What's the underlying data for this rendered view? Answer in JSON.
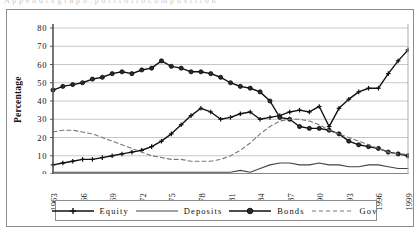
{
  "page": {
    "ghost_header": "A p p e n d i x   g r a p h :  p o r t f o l i o  c o m p o s i t i o n"
  },
  "figure": {
    "y_axis_title": "Percentage"
  },
  "legend": {
    "position": "bottom",
    "items": [
      {
        "label": "Equity",
        "marker": "plus-marker",
        "style": "solid",
        "color": "#111111"
      },
      {
        "label": "Deposits",
        "marker": "none",
        "style": "solid",
        "color": "#444444"
      },
      {
        "label": "Bonds",
        "marker": "circle-marker",
        "style": "solid",
        "color": "#111111"
      },
      {
        "label": "Gov",
        "marker": "none",
        "style": "dashed",
        "color": "#777777"
      }
    ]
  },
  "chart_data": {
    "type": "line",
    "title": "",
    "subtitle": "",
    "xlabel": "",
    "ylabel": "Percentage",
    "ylim": [
      0,
      80
    ],
    "ytick_step": 10,
    "yticks": [
      0,
      10,
      20,
      30,
      40,
      50,
      60,
      70,
      80
    ],
    "grid": true,
    "grid_axis": "y",
    "xlim": [
      1963,
      1999
    ],
    "x": [
      1963,
      1964,
      1965,
      1966,
      1967,
      1968,
      1969,
      1970,
      1971,
      1972,
      1973,
      1974,
      1975,
      1976,
      1977,
      1978,
      1979,
      1980,
      1981,
      1982,
      1983,
      1984,
      1985,
      1986,
      1987,
      1988,
      1989,
      1990,
      1991,
      1992,
      1993,
      1994,
      1995,
      1996,
      1997,
      1998,
      1999
    ],
    "xtick_labels": [
      "1963",
      "1966",
      "1969",
      "1972",
      "1975",
      "1978",
      "1981",
      "1984",
      "1987",
      "1990",
      "1993",
      "1996",
      "1999"
    ],
    "xtick_values": [
      1963,
      1966,
      1969,
      1972,
      1975,
      1978,
      1981,
      1984,
      1987,
      1990,
      1993,
      1996,
      1999
    ],
    "series": [
      {
        "name": "Equity",
        "marker": "plus",
        "style": "solid",
        "color": "#111111",
        "values": [
          5,
          6,
          7,
          8,
          9,
          9,
          10,
          11,
          12,
          13,
          16,
          19,
          23,
          27,
          32,
          36,
          34,
          30,
          31,
          33,
          34,
          33,
          32,
          31,
          30,
          29,
          30,
          31,
          30,
          29,
          28,
          27,
          26,
          25,
          25,
          25,
          25
        ]
      },
      {
        "name": "Deposits",
        "marker": "none",
        "style": "solid",
        "color": "#444444",
        "values": [
          1,
          1,
          1,
          1,
          1,
          1,
          1,
          1,
          1,
          1,
          1,
          1,
          1,
          1,
          1,
          1,
          1,
          1,
          1,
          1,
          2,
          3,
          4,
          5,
          5,
          4,
          5,
          6,
          5,
          5,
          4,
          4,
          4,
          4,
          4,
          3,
          3
        ]
      },
      {
        "name": "Bonds",
        "marker": "circle",
        "style": "solid",
        "color": "#111111",
        "values": [
          46,
          48,
          49,
          50,
          51,
          53,
          55,
          56,
          57,
          58,
          58,
          57,
          54,
          57,
          60,
          62,
          59,
          58,
          56,
          56,
          56,
          55,
          53,
          51,
          49,
          47,
          45,
          40,
          34,
          31,
          29,
          27,
          25,
          22,
          19,
          16,
          14
        ]
      },
      {
        "name": "Gov",
        "marker": "none",
        "style": "dashed",
        "color": "#777777",
        "values": [
          23,
          24,
          24,
          23,
          22,
          21,
          19,
          17,
          15,
          13,
          11,
          10,
          9,
          8,
          8,
          8,
          8,
          8,
          9,
          10,
          12,
          15,
          18,
          21,
          23,
          25,
          26,
          26,
          25,
          24,
          23,
          21,
          19,
          17,
          15,
          13,
          12
        ]
      }
    ],
    "series_overrides": {
      "Equity": {
        "note": "rises from 5 in 1963 to a 1978 local peak near 36, dips to 30 in 1980, plateau ~30-34 through 1989, sharp V-dip to 26 in 1990, then climbs steadily to 68 by 1999",
        "values": [
          5,
          6,
          7,
          8,
          8,
          9,
          10,
          11,
          12,
          13,
          15,
          18,
          22,
          27,
          32,
          36,
          34,
          30,
          31,
          33,
          34,
          30,
          31,
          32,
          34,
          35,
          34,
          37,
          26,
          36,
          41,
          45,
          47,
          47,
          55,
          62,
          68
        ]
      },
      "Bonds": {
        "note": "starts 46, peaks 62 in 1973, falls to 10 by 1999",
        "values": [
          46,
          48,
          49,
          50,
          52,
          53,
          55,
          56,
          55,
          57,
          58,
          62,
          59,
          58,
          56,
          56,
          55,
          53,
          50,
          48,
          47,
          45,
          40,
          31,
          30,
          26,
          25,
          25,
          24,
          22,
          18,
          16,
          15,
          14,
          12,
          11,
          10
        ]
      },
      "Gov": {
        "note": "starts 23, falls to trough ~7 around 1980, rises to ~30 around 1990, falls back to ~11 by 1999",
        "values": [
          23,
          24,
          24,
          23,
          22,
          20,
          18,
          16,
          14,
          12,
          10,
          9,
          8,
          8,
          7,
          7,
          7,
          8,
          10,
          13,
          17,
          22,
          26,
          29,
          30,
          30,
          29,
          27,
          24,
          22,
          20,
          18,
          16,
          14,
          12,
          11,
          11
        ]
      },
      "Deposits": {
        "note": "flat low band 1-6%",
        "values": [
          1,
          1,
          1,
          1,
          1,
          1,
          1,
          1,
          1,
          1,
          1,
          1,
          1,
          1,
          1,
          1,
          1,
          1,
          1,
          2,
          1,
          3,
          5,
          6,
          6,
          5,
          5,
          6,
          5,
          5,
          4,
          4,
          5,
          5,
          4,
          3,
          3
        ]
      }
    }
  }
}
